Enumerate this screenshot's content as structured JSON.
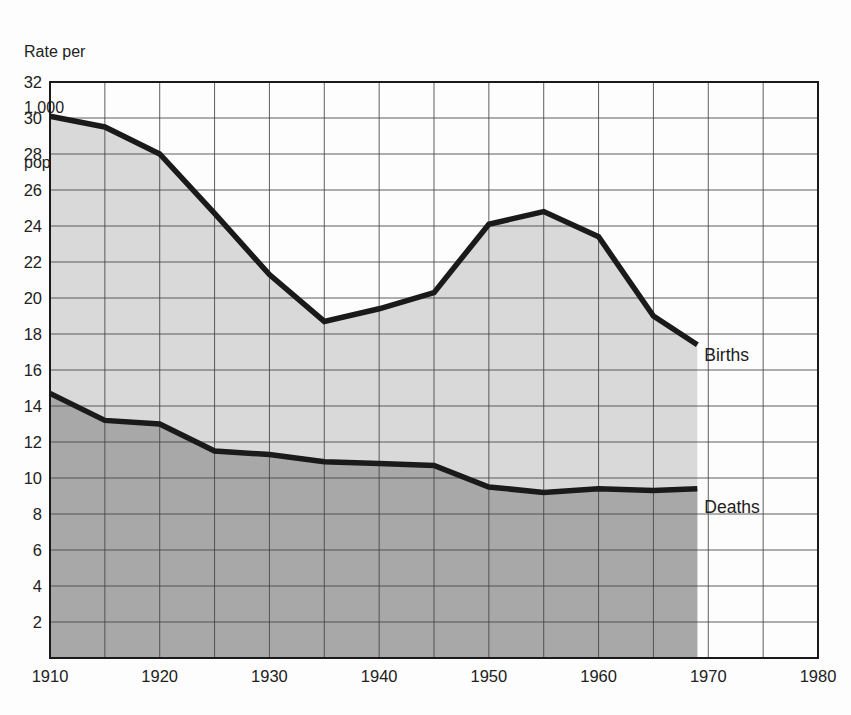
{
  "chart": {
    "y_axis_title_lines": [
      "Rate per",
      "1,000",
      "population"
    ]
  },
  "chart_data": {
    "type": "area",
    "title": "",
    "xlabel": "",
    "ylabel": "Rate per 1,000 population",
    "x": [
      1910,
      1915,
      1920,
      1925,
      1930,
      1935,
      1940,
      1945,
      1950,
      1955,
      1960,
      1965,
      1969
    ],
    "series": [
      {
        "name": "Births",
        "label": "Births",
        "values": [
          30.1,
          29.5,
          28.0,
          24.7,
          21.3,
          18.7,
          19.4,
          20.3,
          24.1,
          24.8,
          23.4,
          19.0,
          17.4
        ],
        "fill": "#d9d9d9"
      },
      {
        "name": "Deaths",
        "label": "Deaths",
        "values": [
          14.7,
          13.2,
          13.0,
          11.5,
          11.3,
          10.9,
          10.8,
          10.7,
          9.5,
          9.2,
          9.4,
          9.3,
          9.4
        ],
        "fill": "#a8a8a8"
      }
    ],
    "xlim": [
      1910,
      1980
    ],
    "ylim": [
      0,
      32
    ],
    "x_ticks": [
      1910,
      1920,
      1930,
      1940,
      1950,
      1960,
      1970,
      1980
    ],
    "y_ticks": [
      2,
      4,
      6,
      8,
      10,
      12,
      14,
      16,
      18,
      20,
      22,
      24,
      26,
      28,
      30,
      32
    ],
    "x_grid_step": 5,
    "y_grid_step": 2,
    "grid": true,
    "legend_position": "inline-right-of-area-end",
    "colors": {
      "line": "#1a1a1a",
      "grid": "#454545",
      "border": "#1a1a1a",
      "text": "#212121",
      "background": "#fdfdfd"
    }
  }
}
